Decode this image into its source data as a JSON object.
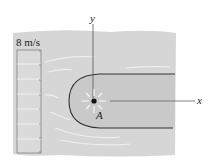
{
  "figure": {
    "velocity_label": "8 m/s",
    "axis_x_label": "x",
    "axis_y_label": "y",
    "point_label": "A",
    "colors": {
      "background": "#ffffff",
      "water": "#d6d6d6",
      "body_fill": "#c8c8c8",
      "body_outline": "#333333",
      "axis": "#555555",
      "streamline": "#eeeeee",
      "point": "#111111"
    }
  }
}
